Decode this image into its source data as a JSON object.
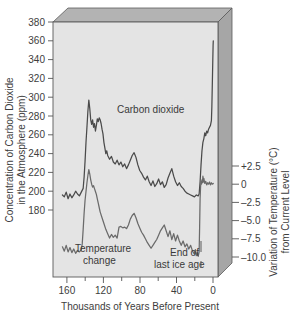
{
  "chart_data": {
    "type": "line",
    "title": "",
    "subtitle": "",
    "xlabel": "Thousands of Years Before Present",
    "xlim": [
      170,
      -5
    ],
    "x_ticks": [
      160,
      120,
      80,
      40,
      0
    ],
    "x_minor_ticks": [
      140,
      100,
      60,
      20
    ],
    "grid": false,
    "legend_position": "inline-annotations",
    "axes": [
      {
        "id": "left",
        "label_line1": "Concentration of Carbon Dioxide",
        "label_line2": "in the Atmosphere (ppm)",
        "label": "Concentration of Carbon Dioxide in the Atmosphere (ppm)",
        "ticks": [
          380,
          360,
          340,
          320,
          300,
          280,
          260,
          240,
          220,
          200,
          180
        ],
        "lim": [
          170,
          390
        ],
        "units": "ppm"
      },
      {
        "id": "right",
        "label_line1": "Variation of Temperature (°C)",
        "label_line2": "from Current Level",
        "label": "Variation of Temperature (°C) from Current Level",
        "ticks": [
          "+2.5",
          "0",
          "–2.5",
          "–5.0",
          "–7.5",
          "–10.0"
        ],
        "tick_values": [
          2.5,
          0,
          -2.5,
          -5.0,
          -7.5,
          -10.0
        ],
        "lim": [
          -11.5,
          4.0
        ],
        "units": "°C"
      }
    ],
    "series": [
      {
        "name": "Carbon dioxide",
        "axis": "left",
        "color": "#4a4a4a",
        "label_text": "Carbon dioxide",
        "units": "ppm",
        "points": [
          [
            160,
            196
          ],
          [
            158,
            194
          ],
          [
            156,
            199
          ],
          [
            154,
            192
          ],
          [
            152,
            197
          ],
          [
            150,
            193
          ],
          [
            148,
            196
          ],
          [
            146,
            200
          ],
          [
            144,
            197
          ],
          [
            142,
            195
          ],
          [
            140,
            199
          ],
          [
            138,
            203
          ],
          [
            137,
            215
          ],
          [
            136,
            232
          ],
          [
            135,
            252
          ],
          [
            134,
            268
          ],
          [
            133,
            285
          ],
          [
            132,
            297
          ],
          [
            131,
            288
          ],
          [
            130,
            276
          ],
          [
            129,
            271
          ],
          [
            128,
            276
          ],
          [
            127,
            268
          ],
          [
            126,
            272
          ],
          [
            125,
            264
          ],
          [
            124,
            270
          ],
          [
            123,
            277
          ],
          [
            122,
            274
          ],
          [
            121,
            278
          ],
          [
            120,
            276
          ],
          [
            119,
            272
          ],
          [
            118,
            266
          ],
          [
            117,
            261
          ],
          [
            116,
            252
          ],
          [
            115,
            246
          ],
          [
            114,
            240
          ],
          [
            113,
            243
          ],
          [
            112,
            238
          ],
          [
            110,
            234
          ],
          [
            108,
            237
          ],
          [
            106,
            231
          ],
          [
            104,
            229
          ],
          [
            102,
            233
          ],
          [
            100,
            228
          ],
          [
            98,
            231
          ],
          [
            96,
            226
          ],
          [
            94,
            229
          ],
          [
            92,
            224
          ],
          [
            90,
            228
          ],
          [
            88,
            233
          ],
          [
            86,
            238
          ],
          [
            84,
            241
          ],
          [
            82,
            236
          ],
          [
            80,
            228
          ],
          [
            78,
            222
          ],
          [
            76,
            219
          ],
          [
            74,
            215
          ],
          [
            72,
            212
          ],
          [
            70,
            216
          ],
          [
            68,
            210
          ],
          [
            66,
            206
          ],
          [
            64,
            211
          ],
          [
            62,
            205
          ],
          [
            60,
            208
          ],
          [
            58,
            213
          ],
          [
            56,
            207
          ],
          [
            54,
            210
          ],
          [
            52,
            204
          ],
          [
            50,
            207
          ],
          [
            48,
            214
          ],
          [
            46,
            219
          ],
          [
            44,
            224
          ],
          [
            42,
            216
          ],
          [
            40,
            210
          ],
          [
            38,
            206
          ],
          [
            36,
            209
          ],
          [
            34,
            205
          ],
          [
            32,
            203
          ],
          [
            30,
            200
          ],
          [
            28,
            198
          ],
          [
            26,
            197
          ],
          [
            24,
            196
          ],
          [
            22,
            195
          ],
          [
            20,
            194
          ],
          [
            18,
            196
          ],
          [
            16,
            195
          ],
          [
            15,
            197
          ],
          [
            14,
            210
          ],
          [
            13,
            228
          ],
          [
            12,
            243
          ],
          [
            11,
            252
          ],
          [
            10,
            256
          ],
          [
            9,
            262
          ],
          [
            8,
            259
          ],
          [
            7,
            264
          ],
          [
            6,
            262
          ],
          [
            5,
            266
          ],
          [
            4,
            268
          ],
          [
            3,
            270
          ],
          [
            2,
            275
          ],
          [
            1.5,
            290
          ],
          [
            1,
            315
          ],
          [
            0.5,
            340
          ],
          [
            0.2,
            355
          ],
          [
            0,
            360
          ]
        ]
      },
      {
        "name": "Temperature change",
        "axis": "right",
        "color": "#6a6a6a",
        "label_line1": "Temperature",
        "label_line2": "change",
        "label_text": "Temperature change",
        "units": "°C",
        "points": [
          [
            160,
            -8.6
          ],
          [
            158,
            -9.2
          ],
          [
            156,
            -8.4
          ],
          [
            154,
            -9.3
          ],
          [
            152,
            -8.7
          ],
          [
            150,
            -9.4
          ],
          [
            148,
            -8.9
          ],
          [
            146,
            -9.5
          ],
          [
            144,
            -9.1
          ],
          [
            142,
            -9.3
          ],
          [
            140,
            -9.0
          ],
          [
            139,
            -8.2
          ],
          [
            138,
            -6.2
          ],
          [
            137,
            -4.0
          ],
          [
            136,
            -2.2
          ],
          [
            135,
            -1.0
          ],
          [
            134,
            0.2
          ],
          [
            133,
            1.2
          ],
          [
            132,
            2.0
          ],
          [
            131,
            1.4
          ],
          [
            130,
            0.6
          ],
          [
            129,
            0.0
          ],
          [
            128,
            -0.4
          ],
          [
            127,
            -0.2
          ],
          [
            126,
            -0.6
          ],
          [
            125,
            -1.0
          ],
          [
            124,
            -1.4
          ],
          [
            123,
            -2.0
          ],
          [
            122,
            -2.6
          ],
          [
            121,
            -3.2
          ],
          [
            120,
            -3.8
          ],
          [
            118,
            -4.6
          ],
          [
            116,
            -5.4
          ],
          [
            114,
            -6.2
          ],
          [
            112,
            -6.8
          ],
          [
            110,
            -7.4
          ],
          [
            108,
            -6.9
          ],
          [
            106,
            -7.3
          ],
          [
            104,
            -7.0
          ],
          [
            102,
            -7.4
          ],
          [
            100,
            -5.9
          ],
          [
            98,
            -5.8
          ],
          [
            96,
            -6.0
          ],
          [
            94,
            -5.9
          ],
          [
            92,
            -6.1
          ],
          [
            90,
            -5.6
          ],
          [
            88,
            -4.8
          ],
          [
            86,
            -4.3
          ],
          [
            84,
            -4.0
          ],
          [
            82,
            -4.6
          ],
          [
            80,
            -5.4
          ],
          [
            78,
            -6.0
          ],
          [
            76,
            -6.6
          ],
          [
            74,
            -7.0
          ],
          [
            72,
            -7.5
          ],
          [
            70,
            -8.0
          ],
          [
            68,
            -8.4
          ],
          [
            66,
            -8.8
          ],
          [
            64,
            -8.4
          ],
          [
            62,
            -8.0
          ],
          [
            60,
            -7.6
          ],
          [
            58,
            -7.0
          ],
          [
            56,
            -6.4
          ],
          [
            54,
            -6.0
          ],
          [
            52,
            -5.6
          ],
          [
            50,
            -6.4
          ],
          [
            48,
            -7.2
          ],
          [
            46,
            -6.4
          ],
          [
            44,
            -7.6
          ],
          [
            42,
            -6.8
          ],
          [
            40,
            -7.8
          ],
          [
            38,
            -7.0
          ],
          [
            36,
            -7.8
          ],
          [
            34,
            -8.4
          ],
          [
            32,
            -7.8
          ],
          [
            30,
            -8.6
          ],
          [
            28,
            -8.2
          ],
          [
            26,
            -8.9
          ],
          [
            24,
            -8.4
          ],
          [
            22,
            -9.2
          ],
          [
            20,
            -9.6
          ],
          [
            19,
            -9.0
          ],
          [
            18,
            -9.8
          ],
          [
            17,
            -9.4
          ],
          [
            16,
            -9.9
          ],
          [
            15,
            -9.3
          ],
          [
            14.5,
            -6.0
          ],
          [
            14,
            -2.0
          ],
          [
            13.5,
            -0.4
          ],
          [
            13,
            0.4
          ],
          [
            12.5,
            0.0
          ],
          [
            12,
            0.6
          ],
          [
            11.5,
            0.2
          ],
          [
            11,
            1.1
          ],
          [
            10.5,
            0.3
          ],
          [
            10,
            0.8
          ],
          [
            9,
            0.1
          ],
          [
            8,
            0.4
          ],
          [
            7,
            -0.1
          ],
          [
            6,
            0.2
          ],
          [
            5,
            0.0
          ],
          [
            4,
            0.3
          ],
          [
            3,
            -0.1
          ],
          [
            2,
            0.2
          ],
          [
            1,
            0.0
          ],
          [
            0,
            0.1
          ]
        ]
      }
    ],
    "annotations": [
      {
        "id": "carbon-dioxide-label",
        "text": "Carbon dioxide",
        "line1": "Carbon dioxide",
        "line2": ""
      },
      {
        "id": "temperature-change-label",
        "text": "Temperature change",
        "line1": "Temperature",
        "line2": "change"
      },
      {
        "id": "end-of-last-ice-age-label",
        "text": "End of last ice age",
        "line1": "End of",
        "line2": "last ice age",
        "pointer_x_kya": 13
      }
    ],
    "colors": {
      "plot_background": "#e3e3e3",
      "box_top_face": "#b4b4b4",
      "box_right_face": "#a8a8a8",
      "frame": "#555555",
      "co2_line": "#4a4a4a",
      "temperature_line": "#6f6f6f",
      "text": "#3d3d3d"
    }
  }
}
